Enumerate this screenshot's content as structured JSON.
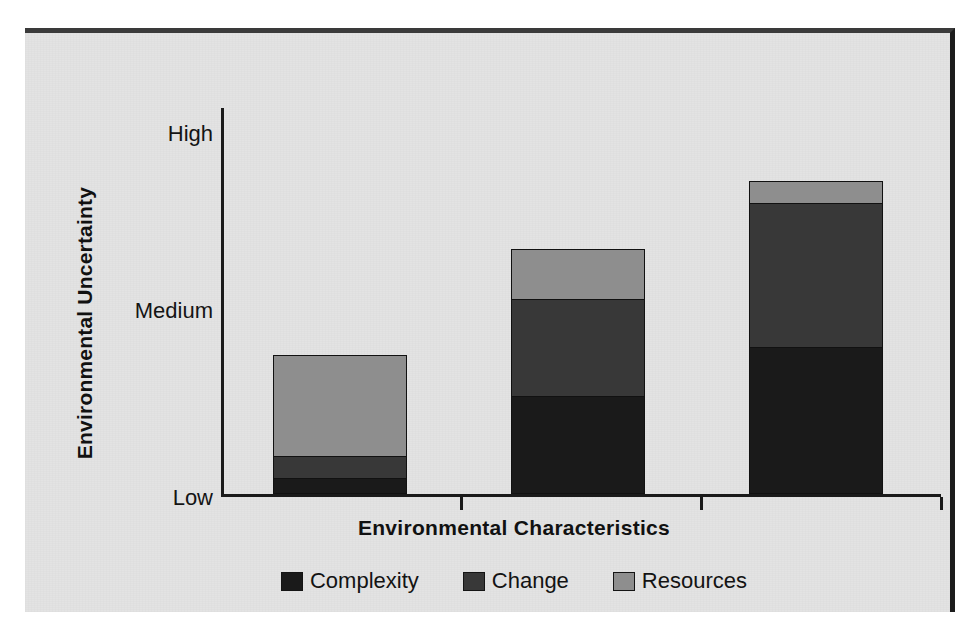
{
  "chart_data": {
    "type": "bar",
    "subtype": "stacked-bar",
    "title": "",
    "xlabel": "Environmental Characteristics",
    "ylabel": "Environmental Uncertainty",
    "categories": [
      "Low Uncertainty",
      "Moderate Uncertainty",
      "High Uncertainty"
    ],
    "ytick_labels": [
      "Low",
      "Medium",
      "High"
    ],
    "ytick_values": [
      0,
      2,
      4
    ],
    "ylim": [
      0,
      4
    ],
    "grid": false,
    "legend_position": "bottom",
    "series": [
      {
        "name": "Complexity",
        "color": "#1a1a1a",
        "values": [
          0.17,
          1.01,
          1.52
        ]
      },
      {
        "name": "Change",
        "color": "#383838",
        "values": [
          0.23,
          1.0,
          1.48
        ]
      },
      {
        "name": "Resources",
        "color": "#8e8e8e",
        "values": [
          1.04,
          0.51,
          0.23
        ]
      }
    ],
    "totals": [
      1.44,
      2.52,
      3.23
    ]
  },
  "axes": {
    "y_title": "Environmental Uncertainty",
    "x_title": "Environmental Characteristics",
    "y_ticks": [
      {
        "label": "High",
        "top_px": 13
      },
      {
        "label": "Medium",
        "top_px": 190
      },
      {
        "label": "Low",
        "top_px": 377
      }
    ],
    "x_ticks": [
      {
        "left_px": 239
      },
      {
        "left_px": 479
      },
      {
        "left_px": 719
      }
    ]
  },
  "bars": [
    {
      "name": "bar-low-uncertainty",
      "left_px": 52,
      "width_px": 134,
      "segments": [
        {
          "series": "Resources",
          "height_px": 101,
          "color": "#8e8e8e"
        },
        {
          "series": "Change",
          "height_px": 22,
          "color": "#383838"
        },
        {
          "series": "Complexity",
          "height_px": 16,
          "color": "#1a1a1a"
        }
      ]
    },
    {
      "name": "bar-moderate-uncertainty",
      "left_px": 290,
      "width_px": 134,
      "segments": [
        {
          "series": "Resources",
          "height_px": 50,
          "color": "#8e8e8e"
        },
        {
          "series": "Change",
          "height_px": 97,
          "color": "#383838"
        },
        {
          "series": "Complexity",
          "height_px": 98,
          "color": "#1a1a1a"
        }
      ]
    },
    {
      "name": "bar-high-uncertainty",
      "left_px": 528,
      "width_px": 134,
      "segments": [
        {
          "series": "Resources",
          "height_px": 22,
          "color": "#8e8e8e"
        },
        {
          "series": "Change",
          "height_px": 144,
          "color": "#383838"
        },
        {
          "series": "Complexity",
          "height_px": 147,
          "color": "#1a1a1a"
        }
      ]
    }
  ],
  "legend": {
    "items": [
      {
        "label": "Complexity",
        "color": "#1a1a1a",
        "swatch_name": "legend-swatch-complexity"
      },
      {
        "label": "Change",
        "color": "#383838",
        "swatch_name": "legend-swatch-change"
      },
      {
        "label": "Resources",
        "color": "#8e8e8e",
        "swatch_name": "legend-swatch-resources"
      }
    ]
  },
  "style": {
    "panel_background": "#e3e3e3",
    "page_background": "#ffffff",
    "axis_color": "#1a1a1a",
    "text_color": "#131313"
  }
}
